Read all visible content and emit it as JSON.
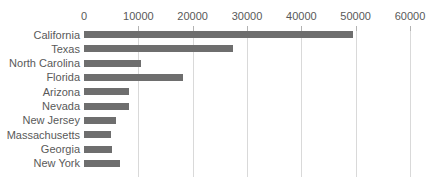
{
  "chart_data": {
    "type": "bar",
    "orientation": "horizontal",
    "title": "",
    "xlabel": "",
    "ylabel": "",
    "categories": [
      "California",
      "Texas",
      "North Carolina",
      "Florida",
      "Arizona",
      "Nevada",
      "New Jersey",
      "Massachusetts",
      "Georgia",
      "New York"
    ],
    "values": [
      49600,
      27500,
      10400,
      18300,
      8200,
      8300,
      5900,
      4900,
      5200,
      6700
    ],
    "x_ticks": [
      0,
      10000,
      20000,
      30000,
      40000,
      50000,
      60000
    ],
    "x_tick_labels": [
      "0",
      "10000",
      "20000",
      "30000",
      "40000",
      "50000",
      "60000"
    ],
    "xlim": [
      0,
      60000
    ],
    "axis_position": "top",
    "grid": true,
    "legend": false,
    "colors": {
      "bar": "#6e6e6e",
      "label": "#595959",
      "gridline": "#d9d9d9",
      "tick": "#b3b3b3",
      "background": "#ffffff"
    }
  }
}
